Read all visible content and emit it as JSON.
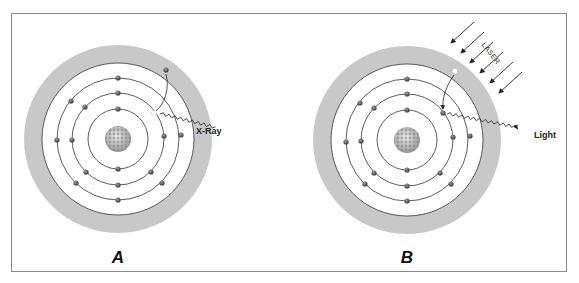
{
  "figure": {
    "panels": [
      {
        "id": "A",
        "label": "A",
        "center": [
          118,
          139
        ],
        "radiation_label": "X-Ray",
        "description": "Inner-shell vacancy filled by outer electron emitting X-ray"
      },
      {
        "id": "B",
        "label": "B",
        "center": [
          407,
          140
        ],
        "radiation_label": "Light",
        "stimulus_label": "LASER",
        "description": "Laser excites electron to outer region; electron falls back emitting light"
      }
    ],
    "colors": {
      "shell_ring": "#c8c8c8",
      "orbit_line": "#333333",
      "electron": "#555555",
      "frame": "#8a8a8a",
      "background": "#ffffff"
    },
    "geometry": {
      "outer_ring_radius": 94,
      "white_radius": 76,
      "orbit_radii": [
        30,
        46,
        61
      ],
      "nucleus_radius": 13
    }
  }
}
